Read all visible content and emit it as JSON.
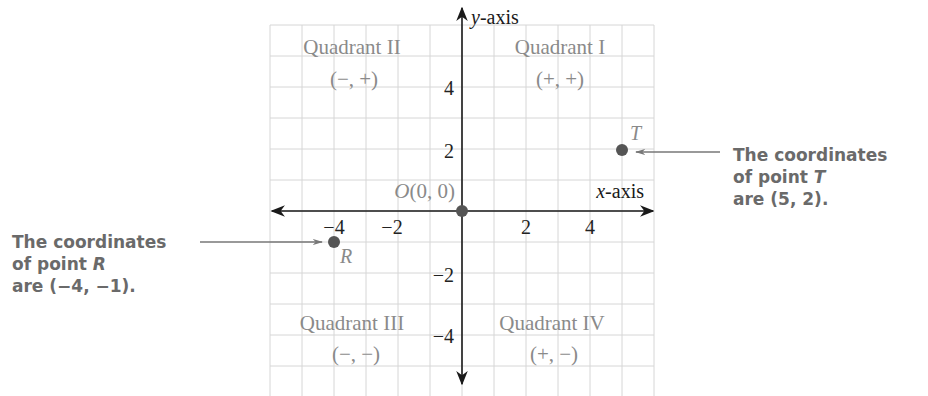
{
  "diagram": {
    "type": "coordinate-plane",
    "grid": {
      "xmin": -6,
      "xmax": 6,
      "ymin": -6,
      "ymax": 6,
      "unit_px_x": 32,
      "unit_px_y": 31,
      "origin_px": [
        462,
        211
      ]
    },
    "axes": {
      "x_label_var": "x",
      "x_label_suffix": "-axis",
      "y_label_var": "y",
      "y_label_suffix": "-axis",
      "x_ticks": [
        {
          "value": -4,
          "label": "−4"
        },
        {
          "value": -2,
          "label": "−2"
        },
        {
          "value": 2,
          "label": "2"
        },
        {
          "value": 4,
          "label": "4"
        }
      ],
      "y_ticks": [
        {
          "value": 4,
          "label": "4"
        },
        {
          "value": 2,
          "label": "2"
        },
        {
          "value": -2,
          "label": "−2"
        },
        {
          "value": -4,
          "label": "−4"
        }
      ]
    },
    "quadrants": [
      {
        "name": "Quadrant II",
        "signs": "(−, +)"
      },
      {
        "name": "Quadrant I",
        "signs": "(+, +)"
      },
      {
        "name": "Quadrant III",
        "signs": "(−, −)"
      },
      {
        "name": "Quadrant IV",
        "signs": "(+, −)"
      }
    ],
    "origin": {
      "label": "O(0, 0)",
      "x": 0,
      "y": 0
    },
    "points": [
      {
        "name": "T",
        "x": 5,
        "y": 2
      },
      {
        "name": "R",
        "x": -4,
        "y": -1
      }
    ],
    "callouts": {
      "T": {
        "line1": "The coordinates",
        "line2_prefix": "of point ",
        "line2_var": "T",
        "line3": "are (5, 2)."
      },
      "R": {
        "line1": "The coordinates",
        "line2_prefix": "of point ",
        "line2_var": "R",
        "line3": "are (−4, −1)."
      }
    },
    "colors": {
      "grid": "#d6d6d6",
      "axis": "#1a1a1a",
      "point": "#555555",
      "muted_text": "#8a8a8a",
      "tick_text": "#222222",
      "callout_text": "#6a6a6a",
      "leader_line": "#777777"
    }
  }
}
